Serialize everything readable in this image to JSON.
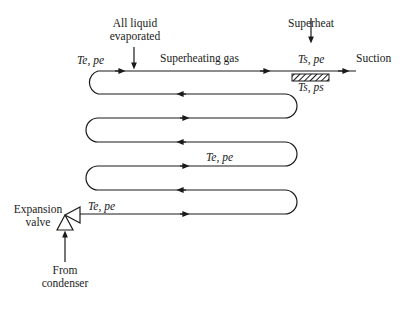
{
  "diagram": {
    "type": "evaporator-coil-schematic",
    "labels": {
      "all_liquid_line1": "All liquid",
      "all_liquid_line2": "evaporated",
      "superheat": "Superheat",
      "superheating_gas": "Superheating gas",
      "suction": "Suction",
      "expansion_line1": "Expansion",
      "expansion_line2": "valve",
      "from_line1": "From",
      "from_line2": "condenser",
      "state_inlet": "Te, pe",
      "state_top_left": "Te, pe",
      "state_middle": "Te, pe",
      "state_superheat_top": "Ts, pe",
      "state_superheat_bottom": "Ts, ps"
    },
    "colors": {
      "line": "#1a1a1a",
      "background": "#ffffff"
    }
  }
}
